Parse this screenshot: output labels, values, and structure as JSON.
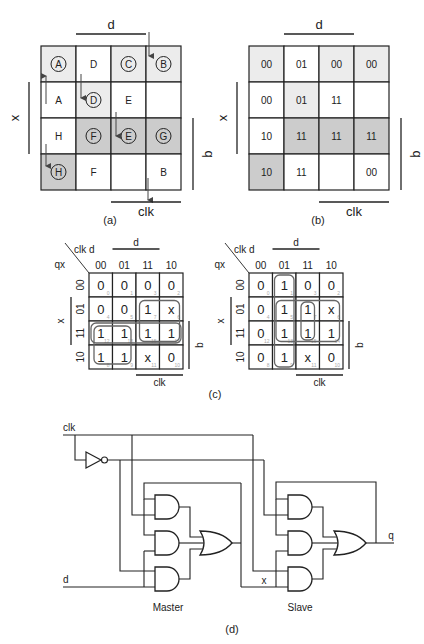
{
  "panel_a": {
    "caption": "(a)",
    "labels": {
      "top": "d",
      "left": "x",
      "right": "q",
      "bottom": "clk"
    },
    "cells": [
      [
        {
          "t": "A",
          "c": true,
          "s": "light"
        },
        {
          "t": "D",
          "c": false,
          "s": "none"
        },
        {
          "t": "C",
          "c": true,
          "s": "light"
        },
        {
          "t": "B",
          "c": true,
          "s": "light"
        }
      ],
      [
        {
          "t": "A",
          "c": false,
          "s": "none"
        },
        {
          "t": "D",
          "c": true,
          "s": "light"
        },
        {
          "t": "E",
          "c": false,
          "s": "none"
        },
        {
          "t": "",
          "c": false,
          "s": "none"
        }
      ],
      [
        {
          "t": "H",
          "c": false,
          "s": "none"
        },
        {
          "t": "F",
          "c": true,
          "s": "dark"
        },
        {
          "t": "E",
          "c": true,
          "s": "dark"
        },
        {
          "t": "G",
          "c": true,
          "s": "dark"
        }
      ],
      [
        {
          "t": "H",
          "c": true,
          "s": "dark"
        },
        {
          "t": "F",
          "c": false,
          "s": "none"
        },
        {
          "t": "",
          "c": false,
          "s": "none"
        },
        {
          "t": "B",
          "c": false,
          "s": "none"
        }
      ]
    ],
    "arrows": [
      {
        "from": "above col 3",
        "to": "B (row 0, col 3)",
        "dir": "down"
      },
      {
        "from": "A (row 1, col 0)",
        "to": "A (row 0, col 0)",
        "dir": "up"
      },
      {
        "from": "D (row 0, col 1)",
        "to": "D (row 1, col 1)",
        "dir": "down"
      },
      {
        "from": "E (row 1, col 2)",
        "to": "E (row 2, col 2)",
        "dir": "down"
      },
      {
        "from": "H (row 2, col 0)",
        "to": "H (row 3, col 0)",
        "dir": "down"
      },
      {
        "from": "B (row 3, col 3)",
        "to": "below col 3",
        "dir": "down"
      }
    ]
  },
  "panel_b": {
    "caption": "(b)",
    "labels": {
      "top": "d",
      "left": "x",
      "right": "q",
      "bottom": "clk"
    },
    "cells": [
      [
        {
          "t": "00",
          "s": "light"
        },
        {
          "t": "01",
          "s": "none"
        },
        {
          "t": "00",
          "s": "light"
        },
        {
          "t": "00",
          "s": "light"
        }
      ],
      [
        {
          "t": "00",
          "s": "none"
        },
        {
          "t": "01",
          "s": "light"
        },
        {
          "t": "11",
          "s": "none"
        },
        {
          "t": "",
          "s": "none"
        }
      ],
      [
        {
          "t": "10",
          "s": "none"
        },
        {
          "t": "11",
          "s": "dark"
        },
        {
          "t": "11",
          "s": "dark"
        },
        {
          "t": "11",
          "s": "dark"
        }
      ],
      [
        {
          "t": "10",
          "s": "dark"
        },
        {
          "t": "11",
          "s": "none"
        },
        {
          "t": "",
          "s": "none"
        },
        {
          "t": "00",
          "s": "none"
        }
      ]
    ]
  },
  "panel_c": {
    "caption": "(c)",
    "maps": [
      {
        "name": "kmap-x",
        "corner_top": "clk d",
        "corner_left": "qx",
        "col_headers": [
          "00",
          "01",
          "11",
          "10"
        ],
        "row_headers": [
          "00",
          "01",
          "11",
          "10"
        ],
        "labels": {
          "top": "d",
          "left": "x",
          "right": "q",
          "bottom": "clk"
        },
        "values": [
          [
            "0",
            "0",
            "0",
            "0"
          ],
          [
            "0",
            "0",
            "1",
            "x"
          ],
          [
            "1",
            "1",
            "1",
            "1"
          ],
          [
            "1",
            "1",
            "x",
            "0"
          ]
        ],
        "minterms": [
          [
            "0",
            "1",
            "3",
            "2"
          ],
          [
            "4",
            "5",
            "7",
            "6"
          ],
          [
            "12",
            "13",
            "15",
            "14"
          ],
          [
            "8",
            "9",
            "11",
            "10"
          ]
        ],
        "groups": [
          {
            "r0": 2,
            "c0": 0,
            "r1": 2,
            "c1": 3
          },
          {
            "r0": 1,
            "c0": 2,
            "r1": 2,
            "c1": 3
          },
          {
            "r0": 2,
            "c0": 0,
            "r1": 3,
            "c1": 1
          }
        ]
      },
      {
        "name": "kmap-q",
        "corner_top": "clk d",
        "corner_left": "qx",
        "col_headers": [
          "00",
          "01",
          "11",
          "10"
        ],
        "row_headers": [
          "00",
          "01",
          "11",
          "10"
        ],
        "labels": {
          "top": "d",
          "left": "x",
          "right": "q",
          "bottom": "clk"
        },
        "values": [
          [
            "0",
            "1",
            "0",
            "0"
          ],
          [
            "0",
            "1",
            "1",
            "x"
          ],
          [
            "0",
            "1",
            "1",
            "1"
          ],
          [
            "0",
            "1",
            "x",
            "0"
          ]
        ],
        "minterms": [
          [
            "0",
            "1",
            "3",
            "2"
          ],
          [
            "4",
            "5",
            "7",
            "6"
          ],
          [
            "12",
            "13",
            "15",
            "14"
          ],
          [
            "8",
            "9",
            "11",
            "10"
          ]
        ],
        "groups": [
          {
            "r0": 0,
            "c0": 1,
            "r1": 3,
            "c1": 1
          },
          {
            "r0": 1,
            "c0": 1,
            "r1": 2,
            "c1": 3
          },
          {
            "r0": 1,
            "c0": 2,
            "r1": 2,
            "c1": 2
          }
        ]
      }
    ]
  },
  "panel_d": {
    "caption": "(d)",
    "inputs": {
      "clk": "clk",
      "d": "d"
    },
    "internal": {
      "x": "x"
    },
    "output": {
      "q": "q"
    },
    "stages": {
      "master": "Master",
      "slave": "Slave"
    }
  },
  "colors": {
    "light_shade": "#ececec",
    "dark_shade": "#cccccc",
    "line": "#222222",
    "group": "#666666"
  }
}
